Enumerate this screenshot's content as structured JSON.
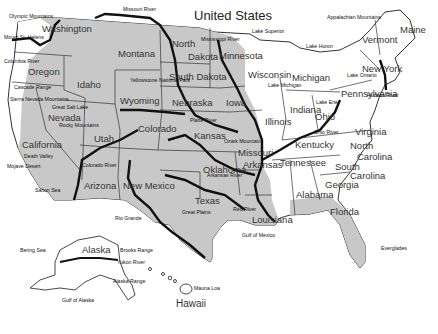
{
  "title": "United States",
  "colors": {
    "shaded": "#c8c8c8",
    "unshaded": "#ffffff",
    "border": "#333333",
    "river": "#111111",
    "water": "#ffffff"
  },
  "states": [
    {
      "name": "Washington",
      "x": 42,
      "y": 24
    },
    {
      "name": "Oregon",
      "x": 28,
      "y": 67
    },
    {
      "name": "California",
      "x": 22,
      "y": 140
    },
    {
      "name": "Nevada",
      "x": 48,
      "y": 113
    },
    {
      "name": "Idaho",
      "x": 77,
      "y": 80
    },
    {
      "name": "Montana",
      "x": 118,
      "y": 49
    },
    {
      "name": "Wyoming",
      "x": 120,
      "y": 96
    },
    {
      "name": "Utah",
      "x": 94,
      "y": 134
    },
    {
      "name": "Colorado",
      "x": 138,
      "y": 124
    },
    {
      "name": "Arizona",
      "x": 84,
      "y": 181
    },
    {
      "name": "New Mexico",
      "x": 123,
      "y": 181
    },
    {
      "name": "North",
      "x": 172,
      "y": 39
    },
    {
      "name": "Dakota",
      "x": 188,
      "y": 52
    },
    {
      "name": "South Dakota",
      "x": 169,
      "y": 72
    },
    {
      "name": "Nebraska",
      "x": 172,
      "y": 98
    },
    {
      "name": "Kansas",
      "x": 194,
      "y": 131
    },
    {
      "name": "Oklahoma",
      "x": 203,
      "y": 165
    },
    {
      "name": "Texas",
      "x": 195,
      "y": 196
    },
    {
      "name": "Minnesota",
      "x": 219,
      "y": 51
    },
    {
      "name": "Iowa",
      "x": 226,
      "y": 98
    },
    {
      "name": "Missouri",
      "x": 238,
      "y": 148
    },
    {
      "name": "Arkansas",
      "x": 243,
      "y": 160
    },
    {
      "name": "Louisiana",
      "x": 252,
      "y": 215
    },
    {
      "name": "Wisconsin",
      "x": 248,
      "y": 70
    },
    {
      "name": "Illinois",
      "x": 265,
      "y": 117
    },
    {
      "name": "Michigan",
      "x": 292,
      "y": 73
    },
    {
      "name": "Indiana",
      "x": 290,
      "y": 105
    },
    {
      "name": "Ohio",
      "x": 315,
      "y": 112
    },
    {
      "name": "Kentucky",
      "x": 295,
      "y": 140
    },
    {
      "name": "Tennessee",
      "x": 280,
      "y": 158
    },
    {
      "name": "Alabama",
      "x": 296,
      "y": 190
    },
    {
      "name": "Georgia",
      "x": 325,
      "y": 180
    },
    {
      "name": "Florida",
      "x": 330,
      "y": 207
    },
    {
      "name": "South",
      "x": 335,
      "y": 162
    },
    {
      "name": "Carolina",
      "x": 350,
      "y": 171
    },
    {
      "name": "North",
      "x": 350,
      "y": 141
    },
    {
      "name": "Carolina",
      "x": 357,
      "y": 152
    },
    {
      "name": "Virginia",
      "x": 355,
      "y": 127
    },
    {
      "name": "Pennsylvania",
      "x": 341,
      "y": 89
    },
    {
      "name": "New York",
      "x": 362,
      "y": 64
    },
    {
      "name": "Vermont",
      "x": 362,
      "y": 35
    },
    {
      "name": "Maine",
      "x": 400,
      "y": 25
    },
    {
      "name": "Alaska",
      "x": 82,
      "y": 245
    },
    {
      "name": "Hawaii",
      "x": 176,
      "y": 299
    }
  ],
  "features": [
    {
      "name": "Olympic Mountains",
      "x": 9,
      "y": 14
    },
    {
      "name": "Mount St. Helens",
      "x": 4,
      "y": 35
    },
    {
      "name": "Columbia River",
      "x": 4,
      "y": 59
    },
    {
      "name": "Cascade Range",
      "x": 14,
      "y": 85
    },
    {
      "name": "Sierra Nevada Mountains",
      "x": 10,
      "y": 97
    },
    {
      "name": "Great Salt Lake",
      "x": 52,
      "y": 105
    },
    {
      "name": "Rocky Mountains",
      "x": 59,
      "y": 123
    },
    {
      "name": "Yellowstone National Park",
      "x": 130,
      "y": 78
    },
    {
      "name": "Death Valley",
      "x": 24,
      "y": 154
    },
    {
      "name": "Mojave Desert",
      "x": 7,
      "y": 164
    },
    {
      "name": "Colorado River",
      "x": 82,
      "y": 163
    },
    {
      "name": "Salton Sea",
      "x": 35,
      "y": 188
    },
    {
      "name": "Missouri River",
      "x": 123,
      "y": 7
    },
    {
      "name": "Mississippi River",
      "x": 201,
      "y": 37
    },
    {
      "name": "Lake Superior",
      "x": 252,
      "y": 29
    },
    {
      "name": "Lake Huron",
      "x": 306,
      "y": 44
    },
    {
      "name": "Lake Michigan",
      "x": 268,
      "y": 83
    },
    {
      "name": "Lake Erie",
      "x": 316,
      "y": 100
    },
    {
      "name": "Lake Ontario",
      "x": 347,
      "y": 73
    },
    {
      "name": "Appalachian Mountains",
      "x": 327,
      "y": 15
    },
    {
      "name": "Hudson River",
      "x": 367,
      "y": 93
    },
    {
      "name": "Platte River",
      "x": 190,
      "y": 118
    },
    {
      "name": "Ozark Mountains",
      "x": 224,
      "y": 139
    },
    {
      "name": "Arkansas River",
      "x": 207,
      "y": 173
    },
    {
      "name": "Ohio River",
      "x": 314,
      "y": 130
    },
    {
      "name": "Red River",
      "x": 233,
      "y": 207
    },
    {
      "name": "Great Plains",
      "x": 182,
      "y": 210
    },
    {
      "name": "Rio Grande",
      "x": 115,
      "y": 216
    },
    {
      "name": "Gulf of Mexico",
      "x": 242,
      "y": 233
    },
    {
      "name": "Everglades",
      "x": 381,
      "y": 246
    },
    {
      "name": "Bering Sea",
      "x": 20,
      "y": 248
    },
    {
      "name": "Brooks Range",
      "x": 120,
      "y": 248
    },
    {
      "name": "Yukon River",
      "x": 117,
      "y": 260
    },
    {
      "name": "Alaska Range",
      "x": 113,
      "y": 279
    },
    {
      "name": "Gulf of Alaska",
      "x": 62,
      "y": 298
    },
    {
      "name": "Mauna Loa",
      "x": 194,
      "y": 286
    }
  ]
}
